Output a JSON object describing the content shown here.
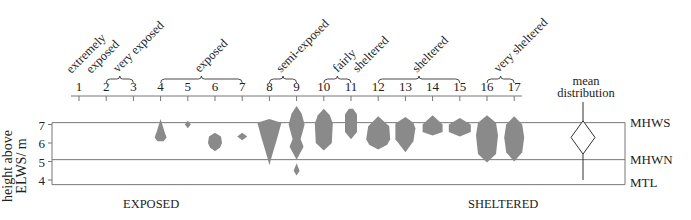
{
  "chart_data": {
    "type": "kite-diagram",
    "title": "",
    "sites": [
      1,
      2,
      3,
      4,
      5,
      6,
      7,
      8,
      9,
      10,
      11,
      12,
      13,
      14,
      15,
      16,
      17
    ],
    "exposure_groups": [
      {
        "label": "extremely exposed",
        "lines": [
          "extremely",
          "exposed"
        ],
        "sites": [
          1
        ]
      },
      {
        "label": "very exposed",
        "lines": [
          "very exposed"
        ],
        "sites": [
          2,
          3
        ]
      },
      {
        "label": "exposed",
        "lines": [
          "exposed"
        ],
        "sites": [
          4,
          5,
          6,
          7
        ]
      },
      {
        "label": "semi-exposed",
        "lines": [
          "semi-exposed"
        ],
        "sites": [
          8,
          9
        ]
      },
      {
        "label": "fairly sheltered",
        "lines": [
          "fairly",
          "sheltered"
        ],
        "sites": [
          10,
          11
        ]
      },
      {
        "label": "sheltered",
        "lines": [
          "sheltered"
        ],
        "sites": [
          12,
          13,
          14,
          15
        ]
      },
      {
        "label": "very sheltered",
        "lines": [
          "very sheltered"
        ],
        "sites": [
          16,
          17
        ]
      }
    ],
    "ylabel": "height above ELWS/ m",
    "ylabel_lines": [
      "height above",
      "ELWS/ m"
    ],
    "yticks": [
      7,
      6,
      5,
      4
    ],
    "ylim": [
      3.7,
      7.1
    ],
    "reference_levels": [
      {
        "name": "MHWS",
        "height": 7.1
      },
      {
        "name": "MHWN",
        "height": 5.1
      },
      {
        "name": "MTL",
        "height": 3.75
      }
    ],
    "xaxis_bottom_labels": {
      "left": "EXPOSED",
      "right": "SHELTERED"
    },
    "mean_distribution_label": [
      "mean",
      "distribution"
    ],
    "kites": [
      {
        "site": 1,
        "present": false
      },
      {
        "site": 2,
        "present": false
      },
      {
        "site": 3,
        "present": false
      },
      {
        "site": 4,
        "top": 7.3,
        "bottom": 6.1,
        "max_width_at": 6.35
      },
      {
        "site": 5,
        "top": 7.15,
        "bottom": 6.85,
        "max_width_at": 7.0
      },
      {
        "site": 6,
        "top": 6.55,
        "bottom": 5.6,
        "max_width_at": 6.1
      },
      {
        "site": 7,
        "top": 6.5,
        "bottom": 6.15,
        "max_width_at": 6.35
      },
      {
        "site": 8,
        "top": 7.4,
        "bottom": 4.8,
        "max_width_at": 7.1
      },
      {
        "site": 9,
        "top": 8.0,
        "bottom": 4.3,
        "note": "three segments: 7.9-6.4, 6.4-5.6, 5.1-4.3"
      },
      {
        "site": 10,
        "top": 7.85,
        "bottom": 5.6,
        "max_width_at": 7.1
      },
      {
        "site": 11,
        "top": 7.85,
        "bottom": 6.2,
        "max_width_at": 7.4
      },
      {
        "site": 12,
        "top": 7.5,
        "bottom": 5.65,
        "max_width_at": 6.6
      },
      {
        "site": 13,
        "top": 7.4,
        "bottom": 5.5,
        "max_width_at": 6.9
      },
      {
        "site": 14,
        "top": 7.5,
        "bottom": 6.4,
        "max_width_at": 6.9
      },
      {
        "site": 15,
        "top": 7.4,
        "bottom": 6.35,
        "max_width_at": 7.0
      },
      {
        "site": 16,
        "top": 7.5,
        "bottom": 4.95,
        "max_width_at": 6.3
      },
      {
        "site": 17,
        "top": 7.45,
        "bottom": 5.0,
        "max_width_at": 6.3
      }
    ],
    "mean_kite": {
      "top": 7.2,
      "bottom": 5.4,
      "line_top": 7.7,
      "line_bottom": 3.8
    },
    "colors": {
      "kite_fill": "#8a8a8a",
      "lines": "#777777",
      "text": "#222222"
    }
  }
}
